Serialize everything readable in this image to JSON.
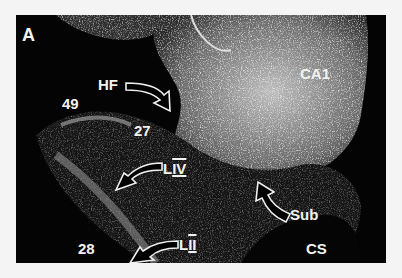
{
  "figure": {
    "panel_letter": "A",
    "background_color": "#f4f4f4",
    "image_background": "#040404",
    "label_color": "#f2f2f2"
  },
  "labels": {
    "hf": "HF",
    "ca1": "CA1",
    "area49": "49",
    "area27": "27",
    "layer4_prefix": "L",
    "layer4_roman": "IV",
    "layer2_prefix": "L",
    "layer2_roman": "II",
    "sub": "Sub",
    "cs": "CS",
    "area28": "28"
  },
  "arrows": [
    {
      "name": "hf-arrow",
      "points_to": "hippocampal fissure"
    },
    {
      "name": "layer4-arrow",
      "points_to": "layer IV"
    },
    {
      "name": "sub-arrow",
      "points_to": "subiculum"
    },
    {
      "name": "layer2-arrow",
      "points_to": "layer II"
    }
  ]
}
